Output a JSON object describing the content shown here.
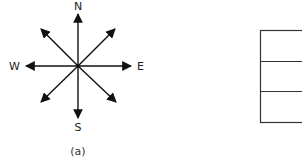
{
  "figure": {
    "compass": {
      "labels": {
        "north": "N",
        "south": "S",
        "east": "E",
        "west": "W"
      },
      "arrow_directions": [
        "N",
        "NE",
        "E",
        "SE",
        "S",
        "SW",
        "W",
        "NW"
      ],
      "caption": "(a)",
      "color": "#111111"
    },
    "grid": {
      "rows": 3,
      "color": "#333333"
    }
  }
}
